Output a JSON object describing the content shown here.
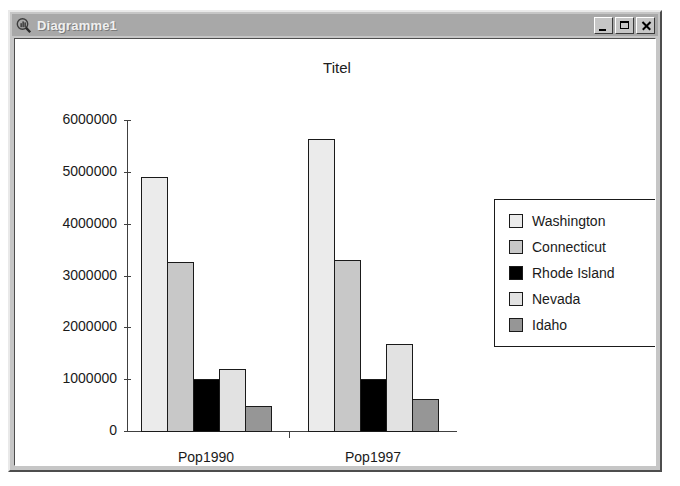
{
  "window": {
    "title": "Diagramme1",
    "icon": "chart-magnifier-icon",
    "buttons": {
      "minimize": "_",
      "maximize": "☐",
      "close": "✕"
    }
  },
  "chart_data": {
    "type": "bar",
    "title": "Titel",
    "xlabel": "",
    "ylabel": "",
    "categories": [
      "Pop1990",
      "Pop1997"
    ],
    "ylim": [
      0,
      6000000
    ],
    "ytick_labels": [
      "0",
      "1000000",
      "2000000",
      "3000000",
      "4000000",
      "5000000",
      "6000000"
    ],
    "ytick_values": [
      0,
      1000000,
      2000000,
      3000000,
      4000000,
      5000000,
      6000000
    ],
    "grid": false,
    "legend_position": "right",
    "series": [
      {
        "name": "Washington",
        "color": "#ebebeb",
        "values": [
          4900000,
          5640000
        ]
      },
      {
        "name": "Connecticut",
        "color": "#c8c8c8",
        "values": [
          3260000,
          3300000
        ]
      },
      {
        "name": "Rhode Island",
        "color": "#000000",
        "values": [
          1000000,
          1000000
        ]
      },
      {
        "name": "Nevada",
        "color": "#e2e2e2",
        "values": [
          1200000,
          1680000
        ]
      },
      {
        "name": "Idaho",
        "color": "#969696",
        "values": [
          480000,
          620000
        ]
      }
    ]
  }
}
